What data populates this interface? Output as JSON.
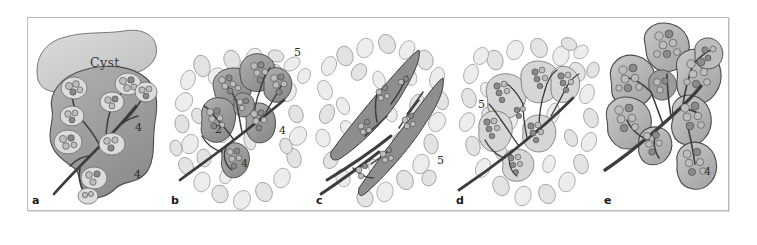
{
  "figure": {
    "type": "medical-illustration",
    "caption_letters": [
      "a",
      "b",
      "c",
      "d",
      "e"
    ],
    "panels": [
      {
        "id": "a",
        "letter": "a",
        "text_labels": [
          "Cyst"
        ],
        "numeric_labels": [
          "4",
          "4"
        ],
        "description": "Glandular lobe with branching duct system and a large overlying cyst"
      },
      {
        "id": "b",
        "letter": "b",
        "text_labels": [],
        "numeric_labels": [
          "5",
          "2",
          "4",
          "4"
        ],
        "description": "Multilobular gland with branching ducts surrounded by adipose tissue"
      },
      {
        "id": "c",
        "letter": "c",
        "text_labels": [],
        "numeric_labels": [
          "5"
        ],
        "description": "Elongated spindle-shaped lobes containing ducts within fatty stroma"
      },
      {
        "id": "d",
        "letter": "d",
        "text_labels": [],
        "numeric_labels": [
          "5"
        ],
        "description": "Branching glandular tree with pale lobules embedded in adipose tissue"
      },
      {
        "id": "e",
        "letter": "e",
        "text_labels": [],
        "numeric_labels": [
          "4"
        ],
        "description": "Isolated branching gland with enlarged lobules, no surrounding fat"
      }
    ]
  },
  "labels": {
    "cyst": "Cyst",
    "a": "a",
    "b": "b",
    "c": "c",
    "d": "d",
    "e": "e",
    "a_num_1": "4",
    "a_num_2": "4",
    "b_num_5": "5",
    "b_num_2": "2",
    "b_num_4a": "4",
    "b_num_4b": "4",
    "c_num_5": "5",
    "d_num_5": "5",
    "e_num_4": "4"
  },
  "colors": {
    "background": "#ffffff",
    "frame_border": "#b9b9b9",
    "lobe_gray": "#9d9d9d",
    "cyst_gray": "#cfcfcf",
    "fat_gray": "#ededed",
    "duct_dark": "#3d3d3d",
    "text": "#1a1a1a"
  }
}
